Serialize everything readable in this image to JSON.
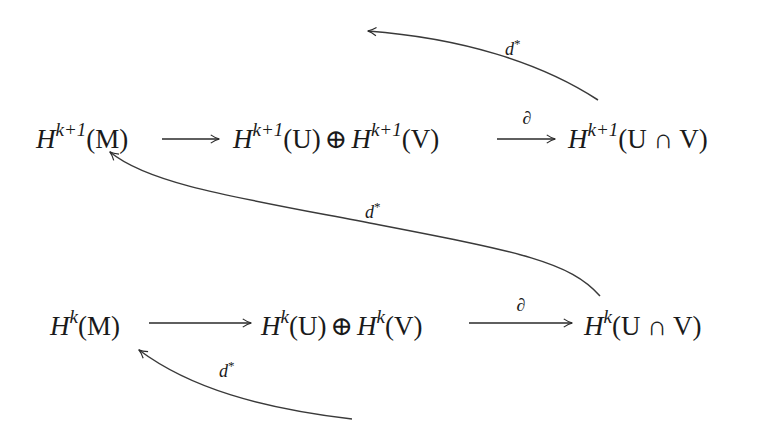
{
  "diagram": {
    "rows": [
      {
        "id": "top",
        "degree_sup": "k+1",
        "nodes": [
          {
            "id": "HM",
            "base": "H",
            "sup": "k+1",
            "arg": "(M)"
          },
          {
            "id": "HUV",
            "base1": "H",
            "sup1": "k+1",
            "arg1": "(U)",
            "op": "⊕",
            "base2": "H",
            "sup2": "k+1",
            "arg2": "(V)"
          },
          {
            "id": "HUnV",
            "base": "H",
            "sup": "k+1",
            "arg": "(U ∩ V)"
          }
        ],
        "arrows": [
          {
            "from": "HM",
            "to": "HUV",
            "label": ""
          },
          {
            "from": "HUV",
            "to": "HUnV",
            "label": "∂"
          }
        ]
      },
      {
        "id": "bottom",
        "degree_sup": "k",
        "nodes": [
          {
            "id": "HM",
            "base": "H",
            "sup": "k",
            "arg": "(M)"
          },
          {
            "id": "HUV",
            "base1": "H",
            "sup1": "k",
            "arg1": "(U)",
            "op": "⊕",
            "base2": "H",
            "sup2": "k",
            "arg2": "(V)"
          },
          {
            "id": "HUnV",
            "base": "H",
            "sup": "k",
            "arg": "(U ∩ V)"
          }
        ],
        "arrows": [
          {
            "from": "HM",
            "to": "HUV",
            "label": ""
          },
          {
            "from": "HUV",
            "to": "HUnV",
            "label": "∂"
          }
        ]
      }
    ],
    "connecting_maps": [
      {
        "id": "d-top",
        "from": "H^{k+1}(U∩V)",
        "to": "H^{k+2}(M) (off-diagram, up-left)",
        "label_base": "d",
        "label_sup": "*"
      },
      {
        "id": "d-middle",
        "from": "H^k(U∩V)",
        "to": "H^{k+1}(M)",
        "label_base": "d",
        "label_sup": "*"
      },
      {
        "id": "d-bottom",
        "from": "H^{k-1}(U∩V) (off-diagram, below)",
        "to": "H^k(M)",
        "label_base": "d",
        "label_sup": "*"
      }
    ],
    "colors": {
      "background": "#ffffff",
      "ink": "#1a1a1a",
      "arrow": "#2a2a2a"
    }
  }
}
